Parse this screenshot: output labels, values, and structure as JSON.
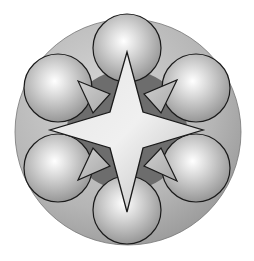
{
  "diagram": {
    "type": "geometric-emblem",
    "background": "#ffffff",
    "outer_circle": {
      "cx": 128,
      "cy": 132,
      "r": 113,
      "fill": "#b8b8b8"
    },
    "spheres": [
      {
        "id": "top",
        "cx": 127,
        "cy": 48,
        "r": 34
      },
      {
        "id": "upper-left",
        "cx": 58,
        "cy": 88,
        "r": 34
      },
      {
        "id": "upper-right",
        "cx": 196,
        "cy": 88,
        "r": 34
      },
      {
        "id": "lower-left",
        "cx": 58,
        "cy": 168,
        "r": 34
      },
      {
        "id": "lower-right",
        "cx": 196,
        "cy": 168,
        "r": 34
      },
      {
        "id": "bottom",
        "cx": 127,
        "cy": 210,
        "r": 34
      }
    ],
    "star": {
      "points": 8,
      "long_points": 4,
      "short_points": 4,
      "fill": "#d4d4d4",
      "stroke": "#1a1a1a"
    }
  }
}
